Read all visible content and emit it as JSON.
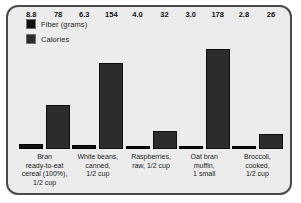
{
  "chart_data": {
    "type": "bar",
    "title": "",
    "subtitle": "",
    "xlabel": "",
    "ylabel": "",
    "grid": false,
    "legend_position": "top-left",
    "ylim": [
      0,
      200
    ],
    "categories": [
      "Bran ready-to-eat cereal (100%), 1/2 cup",
      "White beans, canned, 1/2 cup",
      "Raspberries, raw, 1/2 cup",
      "Oat bran muffin, 1 small",
      "Broccoli, cooked, 1/2 cup"
    ],
    "series": [
      {
        "name": "Fiber (grams)",
        "color": "#101010",
        "values": [
          8.8,
          6.3,
          4.0,
          3.0,
          2.8
        ],
        "labels": [
          "8.8",
          "6.3",
          "4.0",
          "3.0",
          "2.8"
        ]
      },
      {
        "name": "Calories",
        "color": "#2c2c2c",
        "values": [
          78,
          154,
          32,
          178,
          26
        ],
        "labels": [
          "78",
          "154",
          "32",
          "178",
          "26"
        ]
      }
    ]
  },
  "legend": {
    "items": [
      {
        "label": "Fiber (grams)",
        "color": "#101010"
      },
      {
        "label": "Calories",
        "color": "#2c2c2c"
      }
    ]
  },
  "xaxis": {
    "ticks": [
      {
        "line1": "Bran",
        "line2": "ready-to-eat",
        "line3": "cereal (100%),",
        "line4": "1/2 cup"
      },
      {
        "line1": "White beans,",
        "line2": "canned,",
        "line3": "1/2 cup",
        "line4": ""
      },
      {
        "line1": "Raspberries,",
        "line2": "raw, 1/2 cup",
        "line3": "",
        "line4": ""
      },
      {
        "line1": "Oat bran",
        "line2": "muffin,",
        "line3": "1 small",
        "line4": ""
      },
      {
        "line1": "Broccoli,",
        "line2": "cooked,",
        "line3": "1/2 cup",
        "line4": ""
      }
    ]
  },
  "style": {
    "background": "#ececec",
    "border": "#4a4a4a",
    "text": "#1b1b1b"
  }
}
